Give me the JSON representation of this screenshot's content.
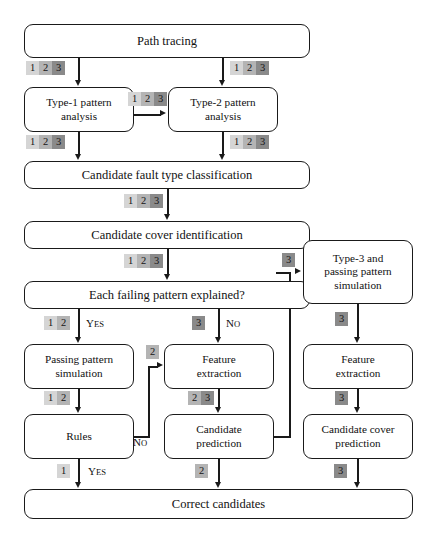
{
  "diagram": {
    "colors": {
      "type1_badge": "#d5d5d5",
      "type2_badge": "#b4b4b4",
      "type3_badge": "#8a8a8a",
      "stroke": "#1a1a1a",
      "background": "#ffffff"
    },
    "nodes": [
      {
        "id": "path_tracing",
        "label": "Path tracing"
      },
      {
        "id": "type1_analysis",
        "label": "Type-1 pattern\nanalysis"
      },
      {
        "id": "type2_analysis",
        "label": "Type-2 pattern\nanalysis"
      },
      {
        "id": "fault_classification",
        "label": "Candidate fault type classification"
      },
      {
        "id": "cover_identification",
        "label": "Candidate cover identification"
      },
      {
        "id": "each_failing",
        "label": "Each failing pattern explained?"
      },
      {
        "id": "passing_sim",
        "label": "Passing pattern\nsimulation"
      },
      {
        "id": "rules",
        "label": "Rules"
      },
      {
        "id": "feature_extraction_mid",
        "label": "Feature\nextraction"
      },
      {
        "id": "candidate_prediction",
        "label": "Candidate\nprediction"
      },
      {
        "id": "type3_sim",
        "label": "Type-3 and\npassing pattern\nsimulation"
      },
      {
        "id": "feature_extraction_right",
        "label": "Feature\nextraction"
      },
      {
        "id": "cover_prediction",
        "label": "Candidate cover\nprediction"
      },
      {
        "id": "correct_candidates",
        "label": "Correct candidates"
      }
    ],
    "badges": [
      {
        "id": "badge-path-to-type1",
        "values": [
          "1",
          "2",
          "3"
        ]
      },
      {
        "id": "badge-path-to-type2",
        "values": [
          "1",
          "2",
          "3"
        ]
      },
      {
        "id": "badge-type1-to-type2",
        "values": [
          "1",
          "2",
          "3"
        ]
      },
      {
        "id": "badge-type1-to-class",
        "values": [
          "1",
          "2",
          "3"
        ]
      },
      {
        "id": "badge-type2-to-class",
        "values": [
          "1",
          "2",
          "3"
        ]
      },
      {
        "id": "badge-class-to-cover",
        "values": [
          "1",
          "2",
          "3"
        ]
      },
      {
        "id": "badge-cover-to-failing",
        "values": [
          "1",
          "2",
          "3"
        ]
      },
      {
        "id": "badge-failing-yes",
        "values": [
          "1",
          "2"
        ]
      },
      {
        "id": "badge-failing-no",
        "values": [
          "3"
        ]
      },
      {
        "id": "badge-pred-to-type3",
        "values": [
          "3"
        ]
      },
      {
        "id": "badge-rules-no-feature",
        "values": [
          "2"
        ]
      },
      {
        "id": "badge-passing-to-rules",
        "values": [
          "1",
          "2"
        ]
      },
      {
        "id": "badge-feature-to-pred",
        "values": [
          "2",
          "3"
        ]
      },
      {
        "id": "badge-type3-to-feature",
        "values": [
          "3"
        ]
      },
      {
        "id": "badge-feature-to-cover-pred",
        "values": [
          "3"
        ]
      },
      {
        "id": "badge-rules-yes-correct",
        "values": [
          "1"
        ]
      },
      {
        "id": "badge-pred-to-correct",
        "values": [
          "2"
        ]
      },
      {
        "id": "badge-coverpred-to-correct",
        "values": [
          "3"
        ]
      }
    ],
    "branch_labels": [
      {
        "id": "label-yes-failing",
        "first": "Y",
        "rest": "ES"
      },
      {
        "id": "label-no-failing",
        "first": "N",
        "rest": "O"
      },
      {
        "id": "label-no-rules",
        "first": "N",
        "rest": "O"
      },
      {
        "id": "label-yes-rules",
        "first": "Y",
        "rest": "ES"
      }
    ]
  }
}
